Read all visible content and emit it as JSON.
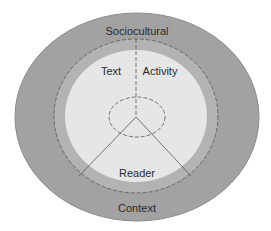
{
  "diagram": {
    "type": "nested-ellipses",
    "labels": {
      "outer_top": "Sociocultural",
      "outer_bottom": "Context",
      "text": "Text",
      "activity": "Activity",
      "reader": "Reader"
    },
    "colors": {
      "outer_fill": "#9e9e9e",
      "ring_fill": "#b0b0b0",
      "inner_fill": "#e4e4e4",
      "stroke": "#555555",
      "background": "#ffffff"
    }
  }
}
